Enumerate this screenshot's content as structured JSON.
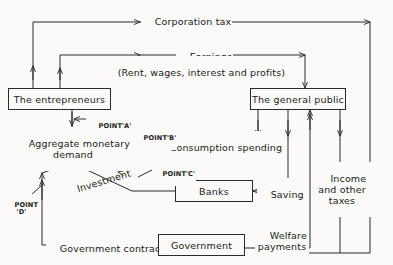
{
  "diagram": {
    "background_color": "#fbfaf8",
    "line_color": "#2a2a2a",
    "text_color": "#1a1a1a",
    "boxes": [
      {
        "id": "entrepreneurs",
        "label": "The entrepreneurs"
      },
      {
        "id": "general_public",
        "label": "The general public"
      },
      {
        "id": "banks",
        "label": "Banks"
      },
      {
        "id": "government",
        "label": "Government"
      }
    ],
    "flow_labels": [
      {
        "id": "corporation_tax",
        "label": "Corporation tax"
      },
      {
        "id": "earnings",
        "label": "Earnings"
      },
      {
        "id": "earnings_detail",
        "label": "(Rent, wages, interest and profits)"
      },
      {
        "id": "aggregate_monetary_demand",
        "label": "Aggregate monetary\ndemand"
      },
      {
        "id": "consumption_spending",
        "label": "Consumption spending"
      },
      {
        "id": "investment",
        "label": "Investment"
      },
      {
        "id": "saving",
        "label": "Saving"
      },
      {
        "id": "income_and_other_taxes",
        "label": "Income\nand other\ntaxes"
      },
      {
        "id": "welfare_payments",
        "label": "Welfare\npayments"
      },
      {
        "id": "government_contracts",
        "label": "Government contracts"
      }
    ],
    "point_labels": [
      {
        "id": "point_a",
        "label": "POINT'A'"
      },
      {
        "id": "point_b",
        "label": "POINT'B'"
      },
      {
        "id": "point_c",
        "label": "POINT'C'"
      },
      {
        "id": "point_d",
        "label": "POINT\n'D'"
      }
    ]
  }
}
